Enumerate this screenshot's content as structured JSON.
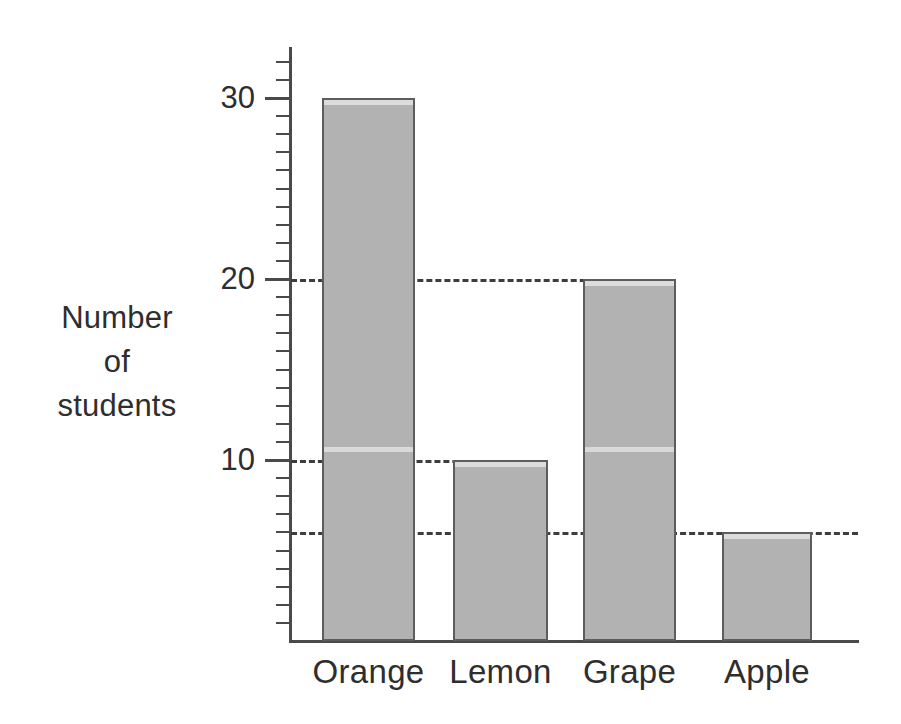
{
  "chart_data": {
    "type": "bar",
    "title": "",
    "xlabel": "",
    "ylabel": "Number of students",
    "ylabel_lines": [
      "Number",
      "of",
      "students"
    ],
    "categories": [
      "Orange",
      "Lemon",
      "Grape",
      "Apple"
    ],
    "values": [
      30,
      10,
      20,
      6
    ],
    "ylim": [
      0,
      32
    ],
    "y_major_ticks": [
      10,
      20,
      30
    ],
    "y_major_tick_labels": [
      "10",
      "20",
      "30"
    ],
    "y_minor_tick_interval": 1,
    "grid": true,
    "gridlines": [
      {
        "value": 20,
        "style": "dashed",
        "extends_to_category": "Grape"
      },
      {
        "value": 10,
        "style": "dashed",
        "extends_to_category": "Lemon"
      },
      {
        "value": 6,
        "style": "dashed",
        "extends_to_category": "Apple"
      }
    ],
    "legend": null,
    "legend_position": "none",
    "bar_fill_color": "#b2b2b2",
    "bar_edge_color": "#5d5d5d",
    "axis_color": "#4a4a4a",
    "background_color": "#ffffff",
    "annotations": []
  }
}
